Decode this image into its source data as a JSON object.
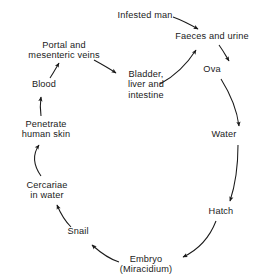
{
  "diagram": {
    "type": "cycle-flow-diagram",
    "colors": {
      "background": "#ffffff",
      "text": "#1a1a1a",
      "arrow": "#1a1a1a"
    },
    "nodes": [
      {
        "id": "infested-man",
        "label": "Infested man",
        "x": 145,
        "y": 10
      },
      {
        "id": "faeces-and-urine",
        "label": "Faeces and urine",
        "x": 212,
        "y": 38
      },
      {
        "id": "ova",
        "label": "Ova",
        "x": 212,
        "y": 72
      },
      {
        "id": "water",
        "label": "Water",
        "x": 224,
        "y": 136
      },
      {
        "id": "hatch",
        "label": "Hatch",
        "x": 221,
        "y": 212
      },
      {
        "id": "embryo",
        "label": "Embryo\n(Miracidium)",
        "x": 146,
        "y": 256
      },
      {
        "id": "snail",
        "label": "Snail",
        "x": 78,
        "y": 232
      },
      {
        "id": "cercariae",
        "label": "Cercariae\nin water",
        "x": 47,
        "y": 182
      },
      {
        "id": "penetrate-skin",
        "label": "Penetrate\nhuman skin",
        "x": 46,
        "y": 122
      },
      {
        "id": "blood",
        "label": "Blood",
        "x": 44,
        "y": 84
      },
      {
        "id": "portal-veins",
        "label": "Portal and\nmesenteric veins",
        "x": 64,
        "y": 42
      },
      {
        "id": "bladder",
        "label": "Bladder,\nliver and\nintestine",
        "x": 146,
        "y": 70
      }
    ],
    "edges": [
      {
        "id": "edge-infested-man-to-faeces",
        "from": "Infested man",
        "to": "Faeces and urine"
      },
      {
        "id": "edge-faeces-to-ova",
        "from": "Faeces and urine",
        "to": "Ova"
      },
      {
        "id": "edge-ova-to-water",
        "from": "Ova",
        "to": "Water"
      },
      {
        "id": "edge-water-to-hatch",
        "from": "Water",
        "to": "Hatch"
      },
      {
        "id": "edge-hatch-to-embryo",
        "from": "Hatch",
        "to": "Embryo (Miracidium)"
      },
      {
        "id": "edge-embryo-to-snail",
        "from": "Embryo (Miracidium)",
        "to": "Snail"
      },
      {
        "id": "edge-snail-to-cercariae",
        "from": "Snail",
        "to": "Cercariae in water"
      },
      {
        "id": "edge-cercariae-to-penetrate",
        "from": "Cercariae in water",
        "to": "Penetrate human skin"
      },
      {
        "id": "edge-penetrate-to-blood",
        "from": "Penetrate human skin",
        "to": "Blood"
      },
      {
        "id": "edge-blood-to-portal",
        "from": "Blood",
        "to": "Portal and mesenteric veins"
      },
      {
        "id": "edge-portal-to-bladder",
        "from": "Portal and mesenteric veins",
        "to": "Bladder, liver and intestine"
      },
      {
        "id": "edge-bladder-to-faeces",
        "from": "Bladder, liver and intestine",
        "to": "Faeces and urine"
      }
    ]
  }
}
